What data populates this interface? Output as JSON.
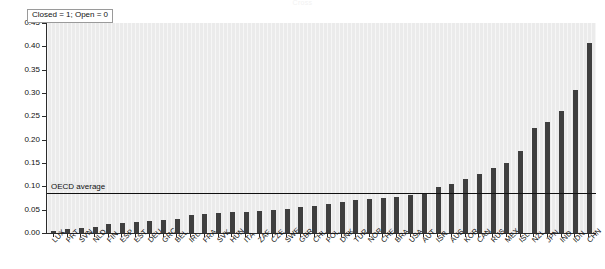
{
  "figure": {
    "title": "Cross",
    "legend_label": "Closed = 1; Open = 0",
    "average_label": "OECD average"
  },
  "axes": {
    "y_ticks": [
      "0.45",
      "0.40",
      "0.35",
      "0.30",
      "0.25",
      "0.20",
      "0.15",
      "0.10",
      "0.05",
      "0.00"
    ],
    "y_min": 0.0,
    "y_max": 0.45
  },
  "colors": {
    "bar": "#3f3f3f",
    "plot_background": "#ebebeb",
    "axis": "#2b2b2b",
    "average_line": "#111111",
    "text": "#111111"
  },
  "chart_data": {
    "type": "bar",
    "title": "Cross",
    "xlabel": "",
    "ylabel": "",
    "ylim": [
      0.0,
      0.45
    ],
    "grid": false,
    "legend_position": "top-left",
    "annotations": [
      {
        "label": "Closed = 1; Open = 0",
        "kind": "legend-box"
      },
      {
        "label": "OECD average",
        "kind": "reference-line",
        "value": 0.086
      }
    ],
    "reference_line": {
      "label": "OECD average",
      "value": 0.086
    },
    "categories": [
      "LUX",
      "PRT",
      "SVN",
      "NLD",
      "FIN",
      "ESP",
      "EST",
      "DEU",
      "GRC",
      "BEL",
      "IRL",
      "FRA",
      "SVK",
      "HUN",
      "ITA",
      "ZAF",
      "CZE",
      "SWE",
      "GBR",
      "CHL",
      "POL",
      "DNK",
      "TUR",
      "NOR",
      "CHE",
      "BRA",
      "USA",
      "AUT",
      "ISR",
      "AUS",
      "KOR",
      "CAN",
      "RUS",
      "MEX",
      "ISL",
      "NZL",
      "JPN",
      "IND",
      "IDN",
      "CHN"
    ],
    "values": [
      0.004,
      0.008,
      0.01,
      0.013,
      0.02,
      0.022,
      0.024,
      0.026,
      0.028,
      0.03,
      0.038,
      0.04,
      0.042,
      0.044,
      0.046,
      0.048,
      0.05,
      0.052,
      0.056,
      0.058,
      0.062,
      0.066,
      0.07,
      0.072,
      0.074,
      0.078,
      0.082,
      0.086,
      0.098,
      0.106,
      0.116,
      0.126,
      0.14,
      0.15,
      0.176,
      0.224,
      0.238,
      0.262,
      0.306,
      0.407
    ],
    "series": [
      {
        "name": "Index value",
        "values": [
          0.004,
          0.008,
          0.01,
          0.013,
          0.02,
          0.022,
          0.024,
          0.026,
          0.028,
          0.03,
          0.038,
          0.04,
          0.042,
          0.044,
          0.046,
          0.048,
          0.05,
          0.052,
          0.056,
          0.058,
          0.062,
          0.066,
          0.07,
          0.072,
          0.074,
          0.078,
          0.082,
          0.086,
          0.098,
          0.106,
          0.116,
          0.126,
          0.14,
          0.15,
          0.176,
          0.224,
          0.238,
          0.262,
          0.306,
          0.407
        ]
      }
    ]
  }
}
